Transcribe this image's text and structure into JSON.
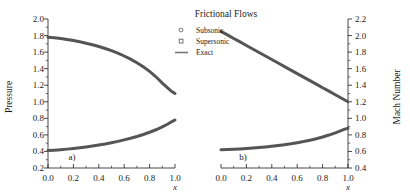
{
  "figure": {
    "legend": {
      "title": "Frictional Flows",
      "entries": [
        {
          "label": "Subsonic",
          "marker": "circle-open-marker"
        },
        {
          "label": "Supersonic",
          "marker": "square-open-marker"
        },
        {
          "label": "Exact",
          "marker": "solid-line-marker"
        }
      ]
    },
    "panels": [
      {
        "tag": "a)",
        "ylabel": "Pressure",
        "xlabel": "x"
      },
      {
        "tag": "b)",
        "ylabel": "Mach Number",
        "xlabel": "x"
      }
    ],
    "colors": {
      "curve": "#555555",
      "axis": "#1a1a1a",
      "background": "#ffffff"
    }
  },
  "chart_data": [
    {
      "type": "line",
      "panel": "a)",
      "title": "Frictional Flows",
      "xlabel": "x",
      "ylabel": "Pressure",
      "xlim": [
        0.0,
        1.0
      ],
      "ylim": [
        0.2,
        2.0
      ],
      "xticks": [
        0.0,
        0.2,
        0.4,
        0.6,
        0.8,
        1.0
      ],
      "yticks": [
        0.2,
        0.4,
        0.6,
        0.8,
        1.0,
        1.2,
        1.4,
        1.6,
        1.8,
        2.0
      ],
      "xtick_labels": [
        "0.0",
        "0.2",
        "0.4",
        "0.6",
        "0.8",
        "1.0"
      ],
      "ytick_labels": [
        "0.2",
        "0.4",
        "0.6",
        "0.8",
        "1.0",
        "1.2",
        "1.4",
        "1.6",
        "1.8",
        "2.0"
      ],
      "grid": false,
      "legend_position": "upper-center-outside",
      "annotations": [
        "a)"
      ],
      "series": [
        {
          "name": "Supersonic",
          "x": [
            0.0,
            0.05,
            0.1,
            0.15,
            0.2,
            0.25,
            0.3,
            0.35,
            0.4,
            0.45,
            0.5,
            0.55,
            0.6,
            0.65,
            0.7,
            0.75,
            0.8,
            0.85,
            0.9,
            0.94,
            0.97,
            0.99,
            1.0
          ],
          "values": [
            1.78,
            1.773,
            1.764,
            1.753,
            1.74,
            1.725,
            1.708,
            1.689,
            1.668,
            1.644,
            1.617,
            1.587,
            1.553,
            1.515,
            1.472,
            1.423,
            1.367,
            1.302,
            1.226,
            1.17,
            1.13,
            1.11,
            1.1
          ]
        },
        {
          "name": "Subsonic",
          "x": [
            0.0,
            0.05,
            0.1,
            0.15,
            0.2,
            0.25,
            0.3,
            0.35,
            0.4,
            0.45,
            0.5,
            0.55,
            0.6,
            0.65,
            0.7,
            0.75,
            0.8,
            0.85,
            0.9,
            0.94,
            0.97,
            0.99,
            1.0
          ],
          "values": [
            0.41,
            0.415,
            0.421,
            0.428,
            0.436,
            0.445,
            0.455,
            0.466,
            0.478,
            0.491,
            0.506,
            0.522,
            0.54,
            0.559,
            0.581,
            0.605,
            0.632,
            0.662,
            0.697,
            0.729,
            0.756,
            0.772,
            0.78
          ]
        }
      ]
    },
    {
      "type": "line",
      "panel": "b)",
      "title": "Frictional Flows",
      "xlabel": "x",
      "ylabel": "Mach Number",
      "xlim": [
        0.0,
        1.0
      ],
      "ylim": [
        0.4,
        2.2
      ],
      "xticks": [
        0.0,
        0.2,
        0.4,
        0.6,
        0.8,
        1.0
      ],
      "yticks": [
        0.4,
        0.6,
        0.8,
        1.0,
        1.2,
        1.4,
        1.6,
        1.8,
        2.0,
        2.2
      ],
      "xtick_labels": [
        "0.0",
        "0.2",
        "0.4",
        "0.6",
        "0.8",
        "1.0"
      ],
      "ytick_labels": [
        "0.4",
        "0.6",
        "0.8",
        "1.0",
        "1.2",
        "1.4",
        "1.6",
        "1.8",
        "2.0",
        "2.2"
      ],
      "grid": false,
      "legend_position": "upper-center-outside",
      "annotations": [
        "b)"
      ],
      "series": [
        {
          "name": "Supersonic",
          "x": [
            0.0,
            0.05,
            0.1,
            0.15,
            0.2,
            0.25,
            0.3,
            0.35,
            0.4,
            0.45,
            0.5,
            0.55,
            0.6,
            0.65,
            0.7,
            0.75,
            0.8,
            0.85,
            0.9,
            0.95,
            1.0
          ],
          "values": [
            2.05,
            2.008,
            1.965,
            1.923,
            1.88,
            1.838,
            1.795,
            1.753,
            1.71,
            1.668,
            1.625,
            1.583,
            1.54,
            1.498,
            1.455,
            1.413,
            1.37,
            1.328,
            1.285,
            1.243,
            1.2
          ]
        },
        {
          "name": "Subsonic",
          "x": [
            0.0,
            0.05,
            0.1,
            0.15,
            0.2,
            0.25,
            0.3,
            0.35,
            0.4,
            0.45,
            0.5,
            0.55,
            0.6,
            0.65,
            0.7,
            0.75,
            0.8,
            0.85,
            0.9,
            0.94,
            0.97,
            0.99,
            1.0
          ],
          "values": [
            0.62,
            0.623,
            0.627,
            0.631,
            0.636,
            0.642,
            0.648,
            0.655,
            0.663,
            0.672,
            0.682,
            0.693,
            0.706,
            0.72,
            0.736,
            0.754,
            0.775,
            0.798,
            0.824,
            0.848,
            0.866,
            0.876,
            0.88
          ]
        }
      ]
    }
  ]
}
